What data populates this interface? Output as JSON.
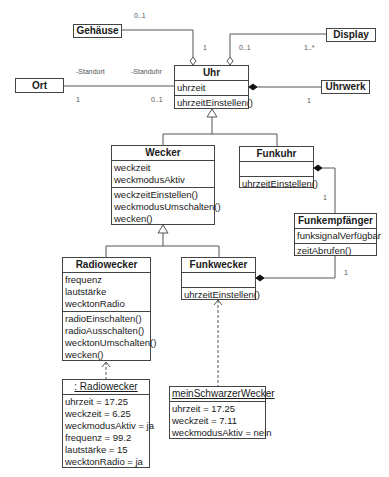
{
  "classes": {
    "gehaeuse": {
      "name": "Gehäuse"
    },
    "display": {
      "name": "Display"
    },
    "ort": {
      "name": "Ort"
    },
    "uhrwerk": {
      "name": "Uhrwerk"
    },
    "uhr": {
      "name": "Uhr",
      "attributes": [
        "uhrzeit"
      ],
      "methods": [
        "uhrzeitEinstellen()"
      ]
    },
    "wecker": {
      "name": "Wecker",
      "attributes": [
        "weckzeit",
        "weckmodusAktiv"
      ],
      "methods": [
        "weckzeitEinstellen()",
        "weckmodusUmschalten()",
        "wecken()"
      ]
    },
    "funkuhr": {
      "name": "Funkuhr",
      "attributes": [],
      "methods": [
        "uhrzeitEinstellen()"
      ]
    },
    "funkempfaenger": {
      "name": "Funkempfänger",
      "attributes": [
        "funksignalVerfügbar"
      ],
      "methods": [
        "zeitAbrufen()"
      ]
    },
    "radiowecker": {
      "name": "Radiowecker",
      "attributes": [
        "frequenz",
        "lautstärke",
        "wecktonRadio"
      ],
      "methods": [
        "radioEinschalten()",
        "radioAusschalten()",
        "wecktonUmschalten()",
        "wecken()"
      ]
    },
    "funkwecker": {
      "name": "Funkwecker",
      "attributes": [],
      "methods": [
        "uhrzeitEinstellen()"
      ]
    }
  },
  "objects": {
    "radiowecker_instance": {
      "name": ": Radiowecker",
      "values": [
        "uhrzeit = 17.25",
        "weckzeit = 6.25",
        "weckmodusAktiv = ja",
        "frequenz = 99.2",
        "lautstärke = 15",
        "wecktonRadio = ja"
      ]
    },
    "mein_schwarzer_wecker": {
      "name": "meinSchwarzerWecker",
      "values": [
        "uhrzeit = 17.25",
        "weckzeit = 7.11",
        "weckmodusAktiv = nein"
      ]
    }
  },
  "labels": {
    "gehaeuse_mult": "0..1",
    "uhr_gehaeuse_mult": "1",
    "uhr_display_mult": "0..1",
    "display_mult": "1..*",
    "role_standort": "-Standort",
    "role_standuhr": "-Standuhr",
    "ort_mult": "1",
    "uhr_ort_mult": "0..1",
    "uhrwerk_mult": "1",
    "funkempfaenger_funkuhr_mult": "1",
    "funkempfaenger_funkwecker_mult": "1"
  }
}
